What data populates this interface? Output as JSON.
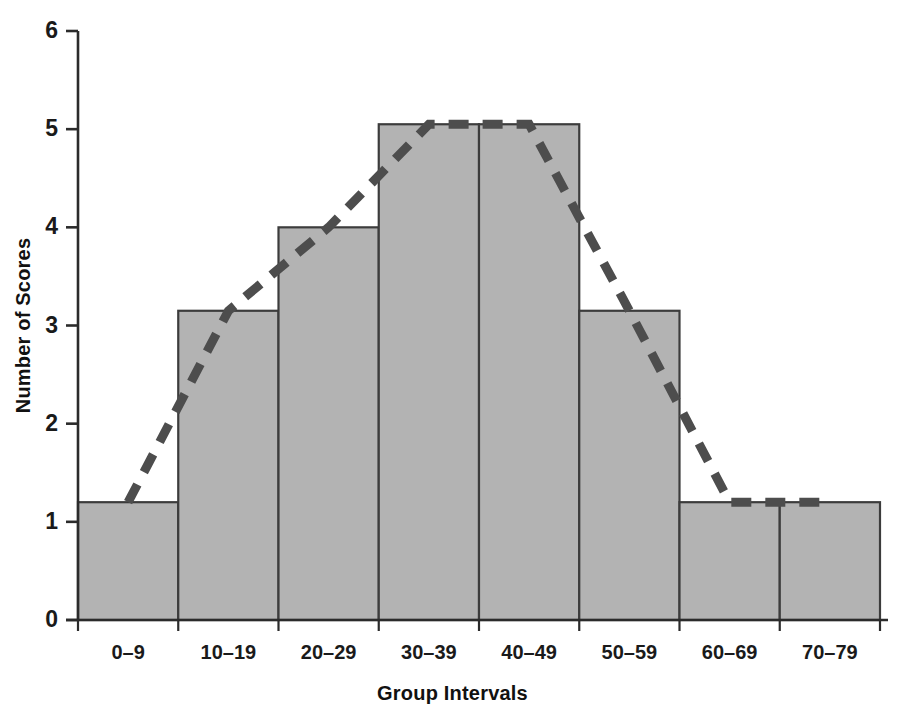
{
  "chart_data": {
    "type": "bar",
    "title": "",
    "subtitle": "",
    "xlabel": "Group Intervals",
    "ylabel": "Number of Scores",
    "categories": [
      "0–9",
      "10–19",
      "20–29",
      "30–39",
      "40–49",
      "50–59",
      "60–69",
      "70–79"
    ],
    "values": [
      1.2,
      3.15,
      4.0,
      5.05,
      5.05,
      3.15,
      1.2,
      1.2
    ],
    "ylim": [
      0,
      6
    ],
    "yticks": [
      0,
      1,
      2,
      3,
      4,
      5,
      6
    ],
    "ytick_labels": [
      "0",
      "1",
      "2",
      "3",
      "4",
      "5",
      "6"
    ],
    "grid": false,
    "legend": "none",
    "overlay": {
      "type": "line",
      "name": "frequency polygon",
      "style": "dashed",
      "color": "#4d4d4d",
      "points_at_bar_midpoints": true,
      "values": [
        1.2,
        3.15,
        4.0,
        5.05,
        5.05,
        3.15,
        1.2,
        1.2
      ]
    },
    "bar_fill": "#b3b3b3",
    "bar_edge": "#3c3c3c",
    "axis_color": "#2b2b2b",
    "background": "#ffffff"
  },
  "axes": {
    "y_title": "Number of Scores",
    "x_title": "Group Intervals"
  }
}
